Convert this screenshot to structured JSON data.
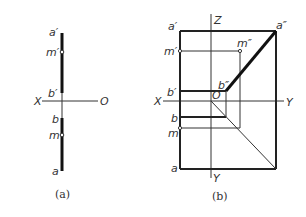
{
  "figure_a": {
    "caption": "(a)",
    "labels": {
      "a_prime": "a′",
      "m_prime": "m′",
      "b_prime": "b′",
      "x_axis": "X",
      "origin": "O",
      "b": "b",
      "m": "m",
      "a": "a"
    }
  },
  "figure_b": {
    "caption": "(b)",
    "labels": {
      "a_prime": "a′",
      "m_prime": "m′",
      "b_prime": "b′",
      "z_axis": "Z",
      "a_dprime": "a″",
      "m_dprime": "m″",
      "b_dprime": "b″",
      "x_axis": "X",
      "origin": "O",
      "y_axis_h": "Y",
      "y_axis_v": "Y",
      "b": "b",
      "m": "m",
      "a": "a"
    }
  }
}
